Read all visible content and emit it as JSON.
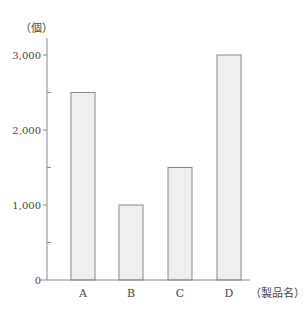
{
  "chart_data": {
    "type": "bar",
    "title": "",
    "xlabel": "（製品名）",
    "ylabel": "（個）",
    "categories": [
      "A",
      "B",
      "C",
      "D"
    ],
    "values": [
      2500,
      1000,
      1500,
      3000
    ],
    "ylim": [
      0,
      3000
    ],
    "yticks_major": [
      0,
      1000,
      2000,
      3000
    ],
    "ytick_labels": [
      "0",
      "1,000",
      "2,000",
      "3,000"
    ],
    "yticks_minor": [
      500,
      1500,
      2500
    ],
    "grid": false,
    "legend": null,
    "colors": {
      "bar_fill": "#efefef",
      "bar_stroke": "#888888",
      "axis": "#888888"
    }
  }
}
